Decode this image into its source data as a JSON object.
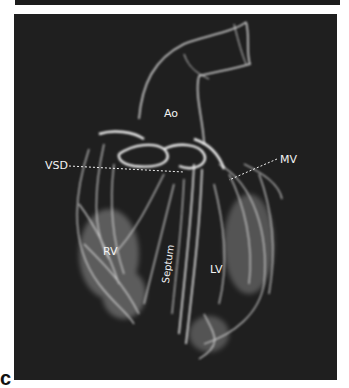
{
  "figure": {
    "panel_letter": "c",
    "labels": {
      "aorta": "Ao",
      "vsd": "VSD",
      "mitral_valve": "MV",
      "right_ventricle": "RV",
      "septum": "Septum",
      "left_ventricle": "LV"
    },
    "colors": {
      "background": "#1f1f1f",
      "tissue": "#e6e6e6",
      "label": "#f2f2f2"
    }
  }
}
